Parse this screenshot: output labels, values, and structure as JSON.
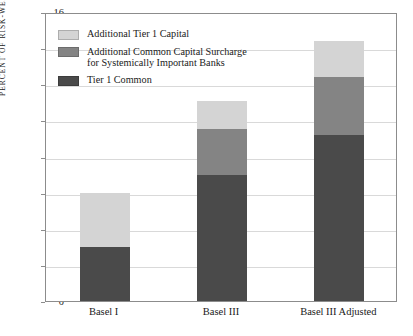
{
  "chart_data": {
    "type": "bar",
    "subtype": "stacked-bar",
    "title": "",
    "xlabel": "",
    "ylabel": "PERCENT OF RISK-WEIGHTED ASSETS",
    "categories": [
      "Basel I",
      "Basel III",
      "Basel III Adjusted"
    ],
    "series": [
      {
        "name": "Tier 1 Common",
        "color": "#4a4a4a",
        "values": [
          3.0,
          7.0,
          9.2
        ]
      },
      {
        "name": "Additional Common Capital Surcharge\nfor Systemically Important Banks",
        "color": "#848484",
        "values": [
          0.0,
          2.5,
          3.2
        ]
      },
      {
        "name": "Additional Tier 1 Capital",
        "color": "#d4d4d4",
        "values": [
          3.0,
          1.6,
          2.0
        ]
      }
    ],
    "totals": [
      6.0,
      11.1,
      14.4
    ],
    "ylim": [
      0,
      16
    ],
    "yticks": [
      0,
      2,
      4,
      6,
      8,
      10,
      12,
      14,
      16
    ],
    "ytick_labels": [
      "0",
      "2",
      "4",
      "6",
      "8",
      "10",
      "12",
      "14",
      "16"
    ],
    "grid": true,
    "legend_position": "upper left inside",
    "stack_order_bottom_to_top": [
      "Tier 1 Common",
      "Additional Common Capital Surcharge for Systemically Important Banks",
      "Additional Tier 1 Capital"
    ]
  },
  "legend": {
    "items": [
      {
        "label": "Additional Tier 1 Capital",
        "color": "#d4d4d4"
      },
      {
        "label": "Additional Common Capital Surcharge\nfor Systemically Important Banks",
        "color": "#848484"
      },
      {
        "label": "Tier 1 Common",
        "color": "#4a4a4a"
      }
    ]
  },
  "axes": {
    "y_title": "PERCENT OF RISK-WEIGHTED ASSETS",
    "y_tick_labels": [
      "16",
      "14",
      "12",
      "10",
      "8",
      "6",
      "4",
      "2",
      "0"
    ],
    "x_tick_labels": [
      "Basel I",
      "Basel III",
      "Basel III Adjusted"
    ]
  }
}
